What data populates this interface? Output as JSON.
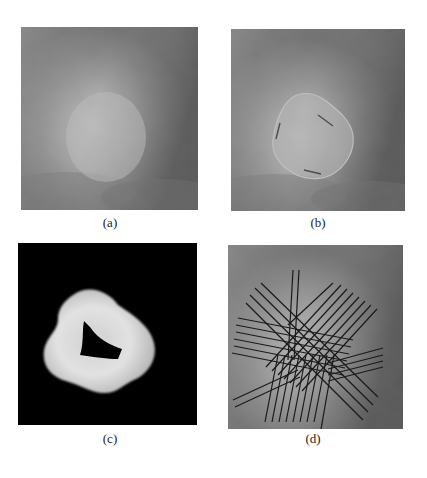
{
  "figure": {
    "panels": [
      {
        "id": "a",
        "caption": "(a)",
        "content": "grayscale mammogram region of interest with bright central mass on darker textured background"
      },
      {
        "id": "b",
        "caption": "(b)",
        "content": "same mammogram region with segmented mass contour outlined, short dark spiculation marks along border"
      },
      {
        "id": "c",
        "caption": "(c)",
        "content": "ribbon-shaped bright band around mass boundary on black background with dark triangular interior"
      },
      {
        "id": "d",
        "caption": "(d)",
        "content": "mammogram region overlaid with bundles of parallel dark lines radiating in multiple directions through the mass"
      }
    ]
  },
  "colors": {
    "background": "#ffffff",
    "mask_background": "#000000",
    "overlay_lines": "#1a1a1a"
  }
}
